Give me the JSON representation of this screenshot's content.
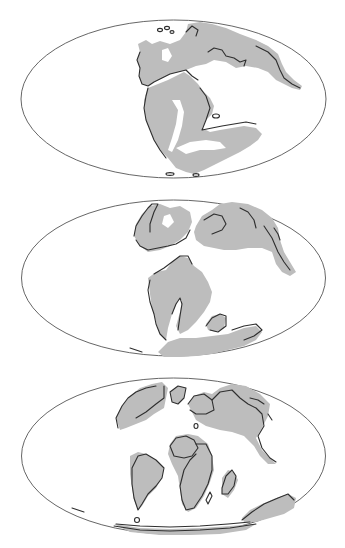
{
  "figure": {
    "type": "paleogeographic-map-series",
    "projection": "mollweide",
    "colors": {
      "background": "#ffffff",
      "land": "#bdbdbd",
      "shelf": "#dcdcdc",
      "coastline": "#2e2e2e",
      "outline": "#555555"
    },
    "panels": [
      {
        "id": "panel-1",
        "position": "top",
        "description": "Supercontinent assembled (Pangaea)",
        "ellipse": {
          "cx": 173.5,
          "cy": 99,
          "rx": 152.5,
          "ry": 79
        }
      },
      {
        "id": "panel-2",
        "position": "middle",
        "description": "Early breakup, Atlantic opening",
        "ellipse": {
          "cx": 173.5,
          "cy": 278,
          "rx": 152,
          "ry": 78
        }
      },
      {
        "id": "panel-3",
        "position": "bottom",
        "description": "Continents near modern configuration",
        "ellipse": {
          "cx": 173.5,
          "cy": 456,
          "rx": 152,
          "ry": 78
        }
      }
    ]
  }
}
